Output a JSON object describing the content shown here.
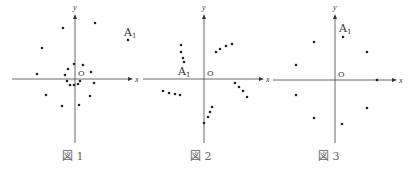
{
  "figures": [
    {
      "caption": "図 1",
      "axis_x_label": "x",
      "axis_y_label": "y",
      "origin_label": "O",
      "point_label": "A1",
      "origin": [
        75,
        79
      ],
      "x_range": [
        12,
        133
      ],
      "y_range": [
        14,
        143
      ],
      "label_pos": [
        124,
        36
      ],
      "caption_pos": [
        62,
        160
      ],
      "points": [
        [
          95,
          23
        ],
        [
          63,
          28
        ],
        [
          42,
          48
        ],
        [
          128,
          40
        ],
        [
          74,
          64
        ],
        [
          83,
          65
        ],
        [
          68,
          69
        ],
        [
          91,
          72
        ],
        [
          37,
          74
        ],
        [
          65,
          75
        ],
        [
          67,
          81
        ],
        [
          80,
          81
        ],
        [
          94,
          83
        ],
        [
          70,
          85
        ],
        [
          74,
          85
        ],
        [
          78,
          84
        ],
        [
          46,
          95
        ],
        [
          90,
          96
        ],
        [
          62,
          106
        ],
        [
          79,
          105
        ]
      ]
    },
    {
      "caption": "図 2",
      "axis_x_label": "x",
      "axis_y_label": "y",
      "origin_label": "O",
      "point_label": "A1",
      "origin": [
        204,
        79
      ],
      "x_range": [
        143,
        264
      ],
      "y_range": [
        14,
        143
      ],
      "label_pos": [
        178,
        75
      ],
      "caption_pos": [
        190,
        160
      ],
      "points": [
        [
          181,
          45
        ],
        [
          181,
          52
        ],
        [
          183,
          58
        ],
        [
          184,
          62
        ],
        [
          216,
          52
        ],
        [
          220,
          49
        ],
        [
          226,
          46
        ],
        [
          232,
          44
        ],
        [
          163,
          91
        ],
        [
          169,
          93
        ],
        [
          175,
          94
        ],
        [
          180,
          95
        ],
        [
          235,
          83
        ],
        [
          239,
          87
        ],
        [
          243,
          91
        ],
        [
          247,
          97
        ],
        [
          212,
          107
        ],
        [
          210,
          112
        ],
        [
          208,
          117
        ],
        [
          204,
          123
        ]
      ]
    },
    {
      "caption": "図 3",
      "axis_x_label": "x",
      "axis_y_label": "y",
      "origin_label": "O",
      "point_label": "A1",
      "origin": [
        335,
        80
      ],
      "x_range": [
        273,
        397
      ],
      "y_range": [
        14,
        143
      ],
      "label_pos": [
        339,
        32
      ],
      "caption_pos": [
        318,
        160
      ],
      "points": [
        [
          343,
          37
        ],
        [
          314,
          42
        ],
        [
          367,
          52
        ],
        [
          296,
          65
        ],
        [
          377,
          80
        ],
        [
          296,
          95
        ],
        [
          367,
          108
        ],
        [
          314,
          118
        ],
        [
          342,
          124
        ]
      ]
    }
  ]
}
